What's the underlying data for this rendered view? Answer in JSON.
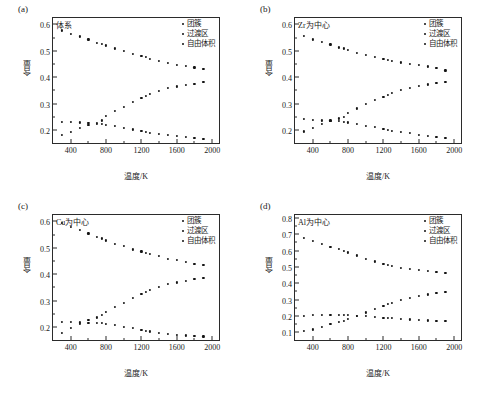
{
  "figure": {
    "xlabel": "温度/K",
    "ylabel": "含量",
    "legend": [
      "团簇",
      "过渡区",
      "自由体积"
    ]
  },
  "chart_data": [
    {
      "type": "scatter",
      "panel": "(a)",
      "title": "体系",
      "xlabel": "温度/K",
      "ylabel": "含量",
      "xlim": [
        200,
        2100
      ],
      "ylim": [
        0.155,
        0.635
      ],
      "xticks": [
        400,
        800,
        1200,
        1600,
        2000
      ],
      "yticks": [
        0.2,
        0.3,
        0.4,
        0.5,
        0.6
      ],
      "grid": false,
      "legend_position": "top-right",
      "x": [
        300,
        400,
        500,
        600,
        700,
        750,
        800,
        900,
        1000,
        1100,
        1200,
        1250,
        1300,
        1400,
        1500,
        1600,
        1700,
        1800,
        1900
      ],
      "series": [
        {
          "name": "团簇",
          "values": [
            0.58,
            0.567,
            0.557,
            0.546,
            0.534,
            0.53,
            0.523,
            0.512,
            0.502,
            0.491,
            0.483,
            0.479,
            0.473,
            0.466,
            0.456,
            0.451,
            0.445,
            0.44,
            0.433
          ]
        },
        {
          "name": "过渡区",
          "values": [
            0.184,
            0.195,
            0.21,
            0.224,
            0.231,
            0.24,
            0.256,
            0.275,
            0.292,
            0.311,
            0.325,
            0.332,
            0.34,
            0.352,
            0.362,
            0.368,
            0.374,
            0.379,
            0.384
          ]
        },
        {
          "name": "自由体积",
          "values": [
            0.234,
            0.234,
            0.232,
            0.229,
            0.228,
            0.226,
            0.223,
            0.219,
            0.211,
            0.206,
            0.2,
            0.197,
            0.194,
            0.189,
            0.185,
            0.181,
            0.177,
            0.173,
            0.17
          ]
        }
      ]
    },
    {
      "type": "scatter",
      "panel": "(b)",
      "title": "Zr为中心",
      "xlabel": "温度/K",
      "ylabel": "含量",
      "xlim": [
        200,
        2100
      ],
      "ylim": [
        0.155,
        0.635
      ],
      "xticks": [
        400,
        800,
        1200,
        1600,
        2000
      ],
      "yticks": [
        0.2,
        0.3,
        0.4,
        0.5,
        0.6
      ],
      "grid": false,
      "legend_position": "top-right",
      "x": [
        300,
        400,
        500,
        600,
        700,
        750,
        800,
        900,
        1000,
        1100,
        1200,
        1250,
        1300,
        1400,
        1500,
        1600,
        1700,
        1800,
        1900
      ],
      "series": [
        {
          "name": "团簇",
          "values": [
            0.558,
            0.546,
            0.537,
            0.527,
            0.516,
            0.512,
            0.506,
            0.496,
            0.488,
            0.479,
            0.472,
            0.468,
            0.464,
            0.459,
            0.453,
            0.449,
            0.444,
            0.437,
            0.429
          ]
        },
        {
          "name": "过渡区",
          "values": [
            0.198,
            0.211,
            0.226,
            0.24,
            0.247,
            0.254,
            0.268,
            0.285,
            0.301,
            0.317,
            0.33,
            0.337,
            0.344,
            0.355,
            0.364,
            0.37,
            0.376,
            0.38,
            0.385
          ]
        },
        {
          "name": "自由体积",
          "values": [
            0.244,
            0.243,
            0.24,
            0.239,
            0.238,
            0.235,
            0.232,
            0.227,
            0.22,
            0.214,
            0.207,
            0.204,
            0.201,
            0.196,
            0.191,
            0.186,
            0.182,
            0.178,
            0.174
          ]
        }
      ]
    },
    {
      "type": "scatter",
      "panel": "(c)",
      "title": "Cu为中心",
      "xlabel": "温度/K",
      "ylabel": "含量",
      "xlim": [
        200,
        2100
      ],
      "ylim": [
        0.155,
        0.635
      ],
      "xticks": [
        400,
        800,
        1200,
        1600,
        2000
      ],
      "yticks": [
        0.2,
        0.3,
        0.4,
        0.5,
        0.6
      ],
      "grid": false,
      "legend_position": "top-right",
      "x": [
        300,
        400,
        500,
        600,
        700,
        750,
        800,
        900,
        1000,
        1100,
        1200,
        1250,
        1300,
        1400,
        1500,
        1600,
        1700,
        1800,
        1900
      ],
      "series": [
        {
          "name": "团簇",
          "values": [
            0.597,
            0.581,
            0.57,
            0.557,
            0.544,
            0.538,
            0.531,
            0.519,
            0.509,
            0.497,
            0.489,
            0.484,
            0.479,
            0.471,
            0.461,
            0.456,
            0.448,
            0.443,
            0.437
          ]
        },
        {
          "name": "过渡区",
          "values": [
            0.181,
            0.2,
            0.215,
            0.23,
            0.24,
            0.248,
            0.261,
            0.279,
            0.296,
            0.314,
            0.328,
            0.335,
            0.343,
            0.355,
            0.365,
            0.372,
            0.379,
            0.384,
            0.39
          ]
        },
        {
          "name": "自由体积",
          "values": [
            0.222,
            0.222,
            0.221,
            0.22,
            0.22,
            0.218,
            0.215,
            0.211,
            0.204,
            0.199,
            0.193,
            0.19,
            0.187,
            0.182,
            0.178,
            0.175,
            0.172,
            0.17,
            0.168
          ]
        }
      ]
    },
    {
      "type": "scatter",
      "panel": "(d)",
      "title": "Al为中心",
      "xlabel": "温度/K",
      "ylabel": "含量",
      "xlim": [
        200,
        2100
      ],
      "ylim": [
        0.06,
        0.835
      ],
      "xticks": [
        400,
        800,
        1200,
        1600,
        2000
      ],
      "yticks": [
        0.1,
        0.2,
        0.3,
        0.4,
        0.5,
        0.6,
        0.7,
        0.8
      ],
      "grid": false,
      "legend_position": "top-right",
      "x": [
        300,
        400,
        500,
        600,
        700,
        750,
        800,
        900,
        1000,
        1100,
        1200,
        1250,
        1300,
        1400,
        1500,
        1600,
        1700,
        1800,
        1900
      ],
      "series": [
        {
          "name": "团簇",
          "values": [
            0.684,
            0.665,
            0.646,
            0.628,
            0.613,
            0.605,
            0.593,
            0.575,
            0.556,
            0.538,
            0.524,
            0.519,
            0.512,
            0.501,
            0.494,
            0.487,
            0.48,
            0.473,
            0.466
          ]
        },
        {
          "name": "过渡区",
          "values": [
            0.112,
            0.124,
            0.14,
            0.156,
            0.168,
            0.177,
            0.19,
            0.208,
            0.227,
            0.249,
            0.267,
            0.277,
            0.287,
            0.303,
            0.317,
            0.328,
            0.337,
            0.345,
            0.353
          ]
        },
        {
          "name": "自由体积",
          "values": [
            0.208,
            0.21,
            0.212,
            0.213,
            0.214,
            0.212,
            0.21,
            0.208,
            0.204,
            0.199,
            0.196,
            0.194,
            0.192,
            0.188,
            0.185,
            0.182,
            0.179,
            0.176,
            0.173
          ]
        }
      ]
    }
  ]
}
